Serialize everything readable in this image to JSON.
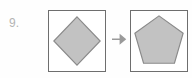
{
  "item": {
    "number_label": "9.",
    "kind": "shape-transformation-item"
  },
  "panels": {
    "before": {
      "shape_name": "diamond",
      "sides": 4,
      "fill": "#c2c2c2",
      "stroke": "#8a8a8a",
      "border": "#6e6e6e",
      "points": "29,6 53,31 29,56 5,31"
    },
    "after": {
      "shape_name": "pentagon",
      "sides": 5,
      "fill": "#c2c2c2",
      "stroke": "#8a8a8a",
      "border": "#6e6e6e",
      "points": "29,5 54,23 45,54 13,54 4,23"
    }
  },
  "arrow": {
    "icon_name": "arrow-right-icon",
    "direction": "right",
    "color": "#9a9a9a"
  },
  "colors": {
    "background": "#fefefe",
    "shape_fill": "#c2c2c2",
    "shape_stroke": "#8a8a8a",
    "panel_border": "#6e6e6e",
    "number_text": "#b4b4b4",
    "arrow": "#9a9a9a"
  }
}
